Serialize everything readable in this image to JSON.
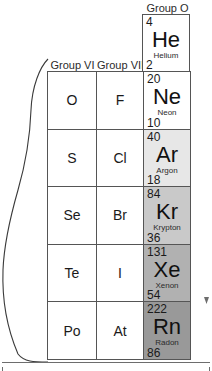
{
  "figure": {
    "kind": "periodic-table-fragment",
    "note_torn_edge": "wavy-break-left-edge"
  },
  "headers": {
    "group_vi": "Group VI",
    "group_vii": "Group VII",
    "group_o": "Group O"
  },
  "helium": {
    "mass": "4",
    "symbol": "He",
    "name": "Helium",
    "number": "2",
    "bg": "#ffffff"
  },
  "rows": [
    {
      "group_vi": "O",
      "group_vii": "F",
      "noble": {
        "mass": "20",
        "symbol": "Ne",
        "name": "Neon",
        "number": "10",
        "bg": "#ffffff"
      }
    },
    {
      "group_vi": "S",
      "group_vii": "Cl",
      "noble": {
        "mass": "40",
        "symbol": "Ar",
        "name": "Argon",
        "number": "18",
        "bg": "#e7e7e7"
      }
    },
    {
      "group_vi": "Se",
      "group_vii": "Br",
      "noble": {
        "mass": "84",
        "symbol": "Kr",
        "name": "Krypton",
        "number": "36",
        "bg": "#c9c9c9"
      }
    },
    {
      "group_vi": "Te",
      "group_vii": "I",
      "noble": {
        "mass": "131",
        "symbol": "Xe",
        "name": "Xenon",
        "number": "54",
        "bg": "#b1b1b1"
      }
    },
    {
      "group_vi": "Po",
      "group_vii": "At",
      "noble": {
        "mass": "222",
        "symbol": "Rn",
        "name": "Radon",
        "number": "86",
        "bg": "#999999"
      }
    }
  ],
  "colors": {
    "border": "#555555",
    "text": "#1a1a1a",
    "rule": "#6d6d6d",
    "page_background": "#ffffff"
  }
}
